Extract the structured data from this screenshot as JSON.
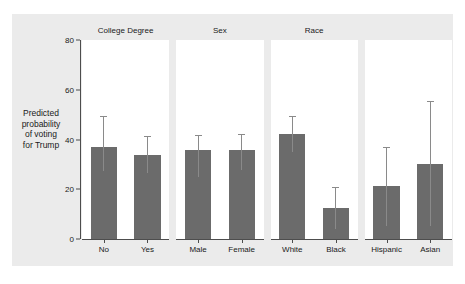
{
  "chart_data": {
    "type": "bar",
    "title": "",
    "xlabel": "",
    "ylabel": "Predicted probability of voting for Trump",
    "ylabel_lines": [
      "Predicted",
      "probability",
      "of voting",
      "for Trump"
    ],
    "ylim": [
      0,
      80
    ],
    "yticks": [
      0,
      20,
      40,
      60,
      80
    ],
    "ytick_labels": [
      "0",
      "20",
      "40",
      "60",
      "80"
    ],
    "grid": false,
    "legend": "none",
    "bar_color": "#6b6b6b",
    "error_color": "#8a8a8a",
    "background_color": "#ebebeb",
    "panel_background_color": "#ffffff",
    "error_bar_note": "95% confidence intervals",
    "panels": [
      {
        "title": "College Degree",
        "categories": [
          "No",
          "Yes"
        ],
        "values": [
          36.8,
          33.8
        ],
        "ci_low": [
          27.2,
          26.7
        ],
        "ci_high": [
          49.3,
          41.6
        ]
      },
      {
        "title": "Sex",
        "categories": [
          "Male",
          "Female"
        ],
        "values": [
          35.8,
          35.7
        ],
        "ci_low": [
          25.1,
          27.8
        ],
        "ci_high": [
          41.7,
          42.2
        ]
      },
      {
        "title": "Race",
        "categories": [
          "White",
          "Black"
        ],
        "values": [
          42.3,
          12.5
        ],
        "ci_low": [
          34.8,
          4.2
        ],
        "ci_high": [
          49.5,
          20.8
        ]
      },
      {
        "title": "",
        "categories": [
          "Hispanic",
          "Asian"
        ],
        "values": [
          21.2,
          30.2
        ],
        "ci_low": [
          5.3,
          5.2
        ],
        "ci_high": [
          37.0,
          55.5
        ]
      }
    ]
  }
}
